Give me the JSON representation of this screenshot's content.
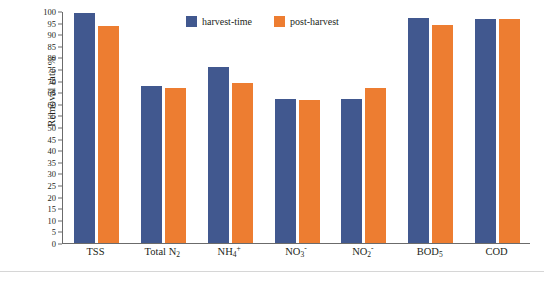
{
  "chart_data": {
    "type": "bar",
    "title": "",
    "xlabel": "",
    "ylabel": "Removal rate %",
    "ylim": [
      0,
      100
    ],
    "ytick_step": 5,
    "yticks": [
      0,
      5,
      10,
      15,
      20,
      25,
      30,
      35,
      40,
      45,
      50,
      55,
      60,
      65,
      70,
      75,
      80,
      85,
      90,
      95,
      100
    ],
    "grid": false,
    "legend_position": "top-center",
    "categories": [
      "TSS",
      "Total N₂",
      "NH₄⁺",
      "NO₃⁻",
      "NO₂⁻",
      "BOD₅",
      "COD"
    ],
    "categories_text": [
      "TSS",
      "Total N2",
      "NH4+",
      "NO3-",
      "NO2-",
      "BOD5",
      "COD"
    ],
    "series": [
      {
        "name": "harvest-time",
        "color": "#41588f",
        "values": [
          99,
          67.5,
          76,
          62,
          62,
          97,
          96.5
        ]
      },
      {
        "name": "post-harvest",
        "color": "#ed7d31",
        "values": [
          93.5,
          67,
          69,
          61.5,
          67,
          94,
          96.5
        ]
      }
    ]
  },
  "legend": {
    "items": [
      {
        "label": "harvest-time",
        "color": "#41588f"
      },
      {
        "label": "post-harvest",
        "color": "#ed7d31"
      }
    ]
  },
  "axis": {
    "y_title": "Removal rate %"
  }
}
